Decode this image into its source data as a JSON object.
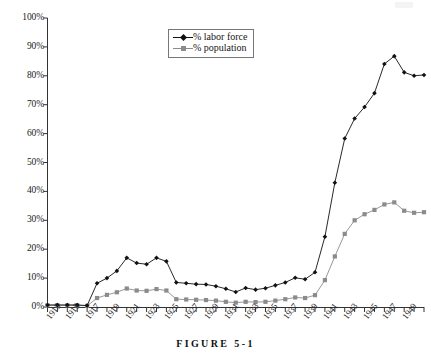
{
  "caption": "FIGURE 5-1",
  "legend": {
    "position": "top-center",
    "items": [
      {
        "label": "% labor force",
        "marker": "diamond-marker-icon",
        "color": "#111111"
      },
      {
        "label": "% population",
        "marker": "square-marker-icon",
        "color": "#8b8b8b"
      }
    ]
  },
  "axes": {
    "y_ticks": [
      "0%",
      "10%",
      "20%",
      "30%",
      "40%",
      "50%",
      "60%",
      "70%",
      "80%",
      "90%",
      "100%"
    ],
    "x_ticks": [
      "1913",
      "1915",
      "1917",
      "1919",
      "1921",
      "1923",
      "1925",
      "1927",
      "1929",
      "1931",
      "1933",
      "1935",
      "1937",
      "1939",
      "1941",
      "1943",
      "1945",
      "1947",
      "1949"
    ]
  },
  "chart_data": {
    "type": "line",
    "title": "",
    "xlabel": "",
    "ylabel": "",
    "xlim": [
      1913,
      1951
    ],
    "ylim": [
      0,
      100
    ],
    "grid": false,
    "legend_position": "top-center",
    "x": [
      1913,
      1914,
      1915,
      1916,
      1917,
      1918,
      1919,
      1920,
      1921,
      1922,
      1923,
      1924,
      1925,
      1926,
      1927,
      1928,
      1929,
      1930,
      1931,
      1932,
      1933,
      1934,
      1935,
      1936,
      1937,
      1938,
      1939,
      1940,
      1941,
      1942,
      1943,
      1944,
      1945,
      1946,
      1947,
      1948,
      1949,
      1950
    ],
    "series": [
      {
        "name": "% labor force",
        "color": "#111111",
        "marker": "diamond",
        "values": [
          0.7,
          0.7,
          0.7,
          0.7,
          0.5,
          8.2,
          10.0,
          12.5,
          17.0,
          15.2,
          14.8,
          17.0,
          15.8,
          8.5,
          8.2,
          7.9,
          7.8,
          7.2,
          6.3,
          5.2,
          6.6,
          6.0,
          6.5,
          7.5,
          8.5,
          10.1,
          9.6,
          12.0,
          24.3,
          43.0,
          58.3,
          65.2,
          69.2,
          74.0,
          84.1,
          86.8,
          81.2,
          80.0
        ],
        "final_point": 80.3
      },
      {
        "name": "% population",
        "color": "#8b8b8b",
        "marker": "square",
        "values": [
          0.6,
          0.6,
          0.6,
          0.6,
          0.4,
          3.1,
          4.2,
          5.1,
          6.4,
          5.7,
          5.6,
          6.2,
          5.7,
          2.7,
          2.6,
          2.5,
          2.4,
          2.2,
          1.8,
          1.5,
          1.8,
          1.7,
          1.8,
          2.2,
          2.7,
          3.3,
          3.1,
          4.1,
          9.3,
          17.5,
          25.3,
          30.0,
          32.1,
          33.6,
          35.5,
          36.2,
          33.3,
          32.6
        ],
        "final_point": 32.8
      }
    ]
  }
}
